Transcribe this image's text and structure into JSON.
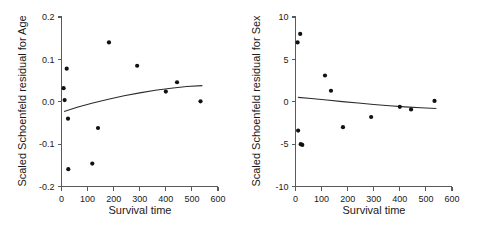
{
  "figure": {
    "background_color": "#ffffff",
    "point_color": "#111111",
    "axis_color": "#5a5a5a",
    "curve_color": "#2b2b2b"
  },
  "chart_data": [
    {
      "type": "scatter",
      "panel": "left",
      "title": "",
      "xlabel": "Survival time",
      "ylabel": "Scaled Schoenfeld residual for Age",
      "xlim": [
        0,
        600
      ],
      "ylim": [
        -0.2,
        0.2
      ],
      "xticks": [
        0,
        100,
        200,
        300,
        400,
        500,
        600
      ],
      "xtick_labels": [
        "0",
        "100",
        "200",
        "300",
        "400",
        "500",
        "600"
      ],
      "yticks": [
        -0.2,
        -0.1,
        0.0,
        0.1,
        0.2
      ],
      "ytick_labels": [
        "-0.2",
        "-0.1",
        "0.0",
        "0.1",
        "0.2"
      ],
      "grid": false,
      "legend": false,
      "points": [
        {
          "x": 8,
          "y": 0.032
        },
        {
          "x": 12,
          "y": 0.004
        },
        {
          "x": 20,
          "y": 0.078
        },
        {
          "x": 25,
          "y": -0.04
        },
        {
          "x": 26,
          "y": -0.159
        },
        {
          "x": 118,
          "y": -0.146
        },
        {
          "x": 140,
          "y": -0.062
        },
        {
          "x": 182,
          "y": 0.14
        },
        {
          "x": 290,
          "y": 0.085
        },
        {
          "x": 400,
          "y": 0.024
        },
        {
          "x": 443,
          "y": 0.046
        },
        {
          "x": 533,
          "y": 0.001
        }
      ],
      "curve": [
        {
          "x": 10,
          "y": -0.023
        },
        {
          "x": 60,
          "y": -0.013
        },
        {
          "x": 120,
          "y": -0.003
        },
        {
          "x": 180,
          "y": 0.006
        },
        {
          "x": 240,
          "y": 0.014
        },
        {
          "x": 300,
          "y": 0.021
        },
        {
          "x": 360,
          "y": 0.027
        },
        {
          "x": 420,
          "y": 0.032
        },
        {
          "x": 480,
          "y": 0.036
        },
        {
          "x": 540,
          "y": 0.038
        }
      ]
    },
    {
      "type": "scatter",
      "panel": "right",
      "title": "",
      "xlabel": "Survival time",
      "ylabel": "Scaled Schoenfeld residual for Sex",
      "xlim": [
        0,
        600
      ],
      "ylim": [
        -10,
        10
      ],
      "xticks": [
        0,
        100,
        200,
        300,
        400,
        500,
        600
      ],
      "xtick_labels": [
        "0",
        "100",
        "200",
        "300",
        "400",
        "500",
        "600"
      ],
      "yticks": [
        -10,
        -5,
        0,
        5,
        10
      ],
      "ytick_labels": [
        "-10",
        "-5",
        "0",
        "5",
        "10"
      ],
      "grid": false,
      "legend": false,
      "points": [
        {
          "x": 8,
          "y": 7.0
        },
        {
          "x": 18,
          "y": 8.0
        },
        {
          "x": 10,
          "y": -3.4
        },
        {
          "x": 20,
          "y": -5.0
        },
        {
          "x": 26,
          "y": -5.1
        },
        {
          "x": 113,
          "y": 3.1
        },
        {
          "x": 136,
          "y": 1.3
        },
        {
          "x": 182,
          "y": -3.0
        },
        {
          "x": 290,
          "y": -1.8
        },
        {
          "x": 400,
          "y": -0.6
        },
        {
          "x": 443,
          "y": -0.9
        },
        {
          "x": 533,
          "y": 0.1
        }
      ],
      "curve": [
        {
          "x": 10,
          "y": 0.52
        },
        {
          "x": 60,
          "y": 0.38
        },
        {
          "x": 120,
          "y": 0.2
        },
        {
          "x": 180,
          "y": 0.02
        },
        {
          "x": 240,
          "y": -0.15
        },
        {
          "x": 300,
          "y": -0.32
        },
        {
          "x": 360,
          "y": -0.47
        },
        {
          "x": 420,
          "y": -0.6
        },
        {
          "x": 480,
          "y": -0.71
        },
        {
          "x": 540,
          "y": -0.79
        }
      ]
    }
  ]
}
